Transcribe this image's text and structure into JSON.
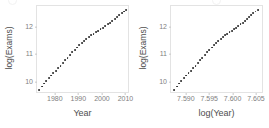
{
  "figure": {
    "background": "#ffffff",
    "point_color": "#262626",
    "axis_text_color": "#808080",
    "axis_title_color": "#4d4d4d",
    "panel_border_color": "#e3e3e3"
  },
  "chart_data": [
    {
      "id": "left",
      "type": "scatter",
      "title": "",
      "xlabel": "Year",
      "ylabel": "log(Exams)",
      "xlim": [
        1972.0,
        2011.5
      ],
      "ylim": [
        9.55,
        12.75
      ],
      "xticks": [
        1980,
        1990,
        2000,
        2010
      ],
      "xticklabels": [
        "1980",
        "1990",
        "2000",
        "2010"
      ],
      "yticks": [
        10,
        11,
        12
      ],
      "yticklabels": [
        "10",
        "11",
        "12"
      ],
      "grid": false,
      "legend": "none",
      "x": [
        1973,
        1974,
        1975,
        1976,
        1977,
        1978,
        1979,
        1980,
        1981,
        1982,
        1983,
        1984,
        1985,
        1986,
        1987,
        1988,
        1989,
        1990,
        1991,
        1992,
        1993,
        1994,
        1995,
        1996,
        1997,
        1998,
        1999,
        2000,
        2001,
        2002,
        2003,
        2004,
        2005,
        2006,
        2007,
        2008,
        2009,
        2010
      ],
      "y": [
        9.7,
        9.82,
        9.93,
        10.03,
        10.13,
        10.22,
        10.31,
        10.4,
        10.49,
        10.58,
        10.67,
        10.77,
        10.87,
        10.97,
        11.07,
        11.16,
        11.24,
        11.32,
        11.4,
        11.47,
        11.55,
        11.62,
        11.68,
        11.74,
        11.79,
        11.85,
        11.91,
        11.96,
        12.02,
        12.08,
        12.14,
        12.2,
        12.27,
        12.34,
        12.42,
        12.49,
        12.55,
        12.6
      ]
    },
    {
      "id": "right",
      "type": "scatter",
      "title": "",
      "xlabel": "log(Year)",
      "ylabel": "log(Exams)",
      "xlim": [
        7.5866,
        7.6065
      ],
      "ylim": [
        9.55,
        12.75
      ],
      "xticks": [
        7.59,
        7.595,
        7.6,
        7.605
      ],
      "xticklabels": [
        "7.590",
        "7.595",
        "7.600",
        "7.605"
      ],
      "yticks": [
        10,
        11,
        12
      ],
      "yticklabels": [
        "10",
        "11",
        "12"
      ],
      "grid": false,
      "legend": "none",
      "x": [
        7.5873,
        7.58781,
        7.58832,
        7.58883,
        7.58934,
        7.58985,
        7.59036,
        7.59086,
        7.59136,
        7.59186,
        7.59236,
        7.59285,
        7.59334,
        7.59384,
        7.59433,
        7.59481,
        7.5953,
        7.59579,
        7.59627,
        7.59675,
        7.59723,
        7.59771,
        7.59819,
        7.59866,
        7.59913,
        7.59961,
        7.60008,
        7.60054,
        7.60101,
        7.60148,
        7.60194,
        7.6024,
        7.60286,
        7.60332,
        7.60378,
        7.60423,
        7.60469,
        7.60514
      ],
      "y": [
        9.7,
        9.82,
        9.93,
        10.03,
        10.13,
        10.22,
        10.31,
        10.4,
        10.49,
        10.58,
        10.67,
        10.77,
        10.87,
        10.97,
        11.07,
        11.16,
        11.24,
        11.32,
        11.4,
        11.47,
        11.55,
        11.62,
        11.68,
        11.74,
        11.79,
        11.85,
        11.91,
        11.96,
        12.02,
        12.08,
        12.14,
        12.2,
        12.27,
        12.34,
        12.42,
        12.49,
        12.55,
        12.6
      ]
    }
  ]
}
